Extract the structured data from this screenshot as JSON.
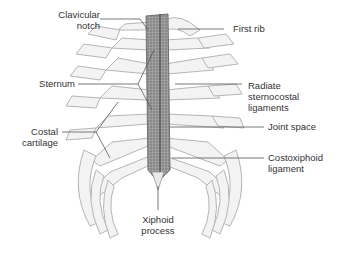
{
  "figure": {
    "colors": {
      "bone": "#f2f2f2",
      "bone_stroke": "#b9b9b9",
      "sternum": "#8a8a8a",
      "leader": "#555555",
      "text": "#333333"
    }
  },
  "labels": {
    "clavicular_notch": {
      "line1": "Clavicular",
      "line2": "notch"
    },
    "first_rib": {
      "line1": "First rib"
    },
    "sternum": {
      "line1": "Sternum"
    },
    "radiate_ligaments": {
      "line1": "Radiate",
      "line2": "sternocostal",
      "line3": "ligaments"
    },
    "costal_cartilage": {
      "line1": "Costal",
      "line2": "cartilage"
    },
    "joint_space": {
      "line1": "Joint space"
    },
    "costoxiphoid_ligament": {
      "line1": "Costoxiphoid",
      "line2": "ligament"
    },
    "xiphoid_process": {
      "line1": "Xiphoid",
      "line2": "process"
    }
  }
}
